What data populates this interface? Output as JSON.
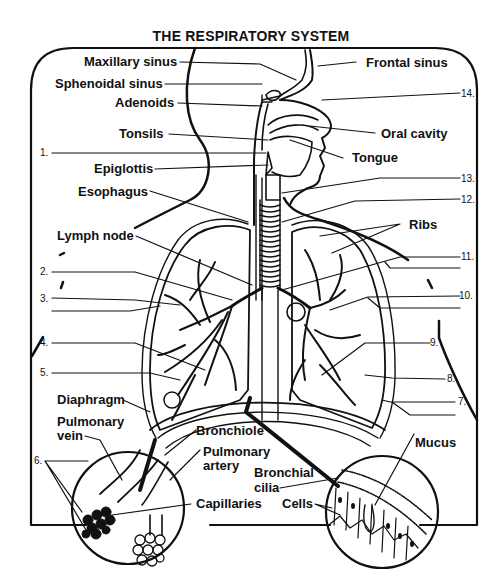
{
  "title": "THE RESPIRATORY SYSTEM",
  "labels": {
    "maxillary_sinus": "Maxillary sinus",
    "frontal_sinus": "Frontal sinus",
    "sphenoidal_sinus": "Sphenoidal sinus",
    "adenoids": "Adenoids",
    "tonsils": "Tonsils",
    "oral_cavity": "Oral cavity",
    "tongue": "Tongue",
    "epiglottis": "Epiglottis",
    "esophagus": "Esophagus",
    "lymph_node": "Lymph node",
    "ribs": "Ribs",
    "diaphragm": "Diaphragm",
    "pulmonary_vein_1": "Pulmonary",
    "pulmonary_vein_2": "vein",
    "bronchiole": "Bronchiole",
    "pulmonary_artery_1": "Pulmonary",
    "pulmonary_artery_2": "artery",
    "bronchial_cilia_1": "Bronchial",
    "bronchial_cilia_2": "cilia",
    "mucus": "Mucus",
    "capillaries": "Capillaries",
    "cells": "Cells"
  },
  "blanks": {
    "n1": "1.",
    "n2": "2.",
    "n3": "3.",
    "n4": "4.",
    "n5": "5.",
    "n6": "6.",
    "n7": "7.",
    "n8": "8.",
    "n9": "9.",
    "n10": "10.",
    "n11": "11.",
    "n12": "12.",
    "n13": "13.",
    "n14": "14."
  },
  "colors": {
    "ink": "#111111",
    "paper": "#ffffff"
  }
}
